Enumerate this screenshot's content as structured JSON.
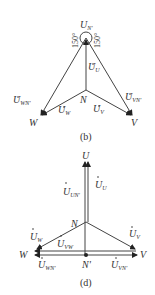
{
  "diagram_b": {
    "caption": "(b)",
    "apex_label": {
      "main": "U",
      "sub": "N'"
    },
    "angle_left": "150°",
    "angle_right": "150°",
    "labels": {
      "U_U": {
        "main": "U",
        "sub": "U"
      },
      "N": "N",
      "U_WN": {
        "main": "U",
        "sub": "WN'"
      },
      "U_W": {
        "main": "U",
        "sub": "W"
      },
      "U_V": {
        "main": "U",
        "sub": "V"
      },
      "U_VN": {
        "main": "U",
        "sub": "VN'"
      },
      "W": "W",
      "V": "V"
    }
  },
  "diagram_d": {
    "caption": "(d)",
    "labels": {
      "U": "U",
      "U_U": {
        "main": "U",
        "sub": "U"
      },
      "U_UN": {
        "main": "U",
        "sub": "UN'"
      },
      "N": "N",
      "U_W": {
        "main": "U",
        "sub": "W"
      },
      "U_VW": {
        "main": "U",
        "sub": "VW"
      },
      "U_V": {
        "main": "U",
        "sub": "V"
      },
      "W": "W",
      "V": "V",
      "N_prime": "N'",
      "U_WN": {
        "main": "U",
        "sub": "WN'"
      },
      "U_VN": {
        "main": "U",
        "sub": "VN'"
      }
    }
  }
}
